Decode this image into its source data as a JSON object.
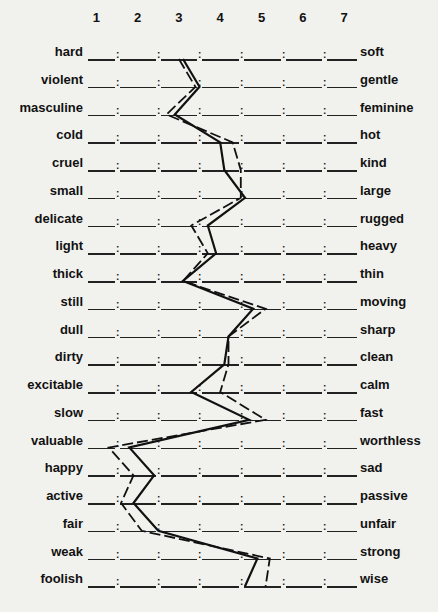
{
  "chart_data": {
    "type": "line",
    "title": "",
    "scale_points": [
      "1",
      "2",
      "3",
      "4",
      "5",
      "6",
      "7"
    ],
    "categories": [
      {
        "left": "hard",
        "right": "soft"
      },
      {
        "left": "violent",
        "right": "gentle"
      },
      {
        "left": "masculine",
        "right": "feminine"
      },
      {
        "left": "cold",
        "right": "hot"
      },
      {
        "left": "cruel",
        "right": "kind"
      },
      {
        "left": "small",
        "right": "large"
      },
      {
        "left": "delicate",
        "right": "rugged"
      },
      {
        "left": "light",
        "right": "heavy"
      },
      {
        "left": "thick",
        "right": "thin"
      },
      {
        "left": "still",
        "right": "moving"
      },
      {
        "left": "dull",
        "right": "sharp"
      },
      {
        "left": "dirty",
        "right": "clean"
      },
      {
        "left": "excitable",
        "right": "calm"
      },
      {
        "left": "slow",
        "right": "fast"
      },
      {
        "left": "valuable",
        "right": "worthless"
      },
      {
        "left": "happy",
        "right": "sad"
      },
      {
        "left": "active",
        "right": "passive"
      },
      {
        "left": "fair",
        "right": "unfair"
      },
      {
        "left": "weak",
        "right": "strong"
      },
      {
        "left": "foolish",
        "right": "wise"
      }
    ],
    "series": [
      {
        "name": "solid profile",
        "style": "solid",
        "values": [
          3.1,
          3.5,
          2.9,
          4.0,
          4.1,
          4.6,
          3.7,
          3.9,
          3.1,
          4.8,
          4.2,
          4.1,
          3.3,
          4.7,
          1.8,
          2.4,
          1.9,
          2.5,
          4.9,
          4.6
        ]
      },
      {
        "name": "dashed profile",
        "style": "dashed",
        "values": [
          3.0,
          3.4,
          2.7,
          4.3,
          4.5,
          4.5,
          3.3,
          3.7,
          3.1,
          5.1,
          4.2,
          4.2,
          4.0,
          5.1,
          1.3,
          1.9,
          1.6,
          2.1,
          5.2,
          5.1
        ]
      }
    ],
    "xlabel": "",
    "ylabel": "",
    "xlim": [
      1,
      7
    ],
    "grid": false,
    "legend": "none",
    "orientation": "vertical profile (semantic differential)"
  },
  "colors": {
    "background": "#f1f1ee",
    "ink": "#111111"
  }
}
